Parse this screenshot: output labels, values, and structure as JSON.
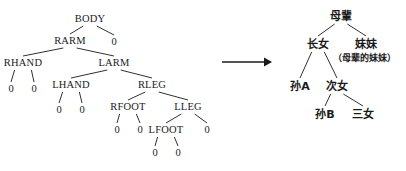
{
  "figure": {
    "type": "diagram",
    "kind": "binary-tree-transformation",
    "background_color": "#ffffff",
    "ink_color": "#1a1a1a",
    "arrow": {
      "name": "transformation-arrow",
      "direction": "right",
      "x1": 222,
      "y1": 62,
      "x2": 272,
      "y2": 62
    }
  },
  "left_tree": {
    "title": "body-parts-binary-tree",
    "nodes": [
      {
        "id": "body",
        "label": "BODY",
        "x": 90,
        "y": 19,
        "kind": "internal"
      },
      {
        "id": "rarm",
        "label": "RARM",
        "x": 70,
        "y": 41,
        "kind": "internal"
      },
      {
        "id": "n1",
        "label": "0",
        "x": 114,
        "y": 42,
        "kind": "leaf"
      },
      {
        "id": "rhand",
        "label": "RHAND",
        "x": 23,
        "y": 63,
        "kind": "internal"
      },
      {
        "id": "larm",
        "label": "LARM",
        "x": 114,
        "y": 63,
        "kind": "internal"
      },
      {
        "id": "n2",
        "label": "0",
        "x": 11,
        "y": 89,
        "kind": "leaf"
      },
      {
        "id": "n3",
        "label": "0",
        "x": 34,
        "y": 89,
        "kind": "leaf"
      },
      {
        "id": "lhand",
        "label": "LHAND",
        "x": 71,
        "y": 85,
        "kind": "internal"
      },
      {
        "id": "rleg",
        "label": "RLEG",
        "x": 152,
        "y": 85,
        "kind": "internal"
      },
      {
        "id": "n4",
        "label": "0",
        "x": 59,
        "y": 110,
        "kind": "leaf"
      },
      {
        "id": "n5",
        "label": "0",
        "x": 82,
        "y": 110,
        "kind": "leaf"
      },
      {
        "id": "rfoot",
        "label": "RFOOT",
        "x": 128,
        "y": 107,
        "kind": "internal"
      },
      {
        "id": "lleg",
        "label": "LLEG",
        "x": 188,
        "y": 107,
        "kind": "internal"
      },
      {
        "id": "n6",
        "label": "0",
        "x": 117,
        "y": 130,
        "kind": "leaf"
      },
      {
        "id": "n7",
        "label": "0",
        "x": 140,
        "y": 130,
        "kind": "leaf"
      },
      {
        "id": "lfoot",
        "label": "LFOOT",
        "x": 166,
        "y": 130,
        "kind": "internal"
      },
      {
        "id": "n8",
        "label": "0",
        "x": 207,
        "y": 130,
        "kind": "leaf"
      },
      {
        "id": "n9",
        "label": "0",
        "x": 155,
        "y": 153,
        "kind": "leaf"
      },
      {
        "id": "n10",
        "label": "0",
        "x": 178,
        "y": 153,
        "kind": "leaf"
      }
    ],
    "edges": [
      {
        "from": "body",
        "to": "rarm"
      },
      {
        "from": "body",
        "to": "n1"
      },
      {
        "from": "rarm",
        "to": "rhand"
      },
      {
        "from": "rarm",
        "to": "larm"
      },
      {
        "from": "rhand",
        "to": "n2"
      },
      {
        "from": "rhand",
        "to": "n3"
      },
      {
        "from": "larm",
        "to": "lhand"
      },
      {
        "from": "larm",
        "to": "rleg"
      },
      {
        "from": "lhand",
        "to": "n4"
      },
      {
        "from": "lhand",
        "to": "n5"
      },
      {
        "from": "rleg",
        "to": "rfoot"
      },
      {
        "from": "rleg",
        "to": "lleg"
      },
      {
        "from": "rfoot",
        "to": "n6"
      },
      {
        "from": "rfoot",
        "to": "n7"
      },
      {
        "from": "lleg",
        "to": "lfoot"
      },
      {
        "from": "lleg",
        "to": "n8"
      },
      {
        "from": "lfoot",
        "to": "n9"
      },
      {
        "from": "lfoot",
        "to": "n10"
      }
    ]
  },
  "right_tree": {
    "title": "family-relation-tree",
    "nodes": [
      {
        "id": "mubei",
        "label": "母輩",
        "x": 341,
        "y": 16,
        "kind": "cjk"
      },
      {
        "id": "zhangnv",
        "label": "长女",
        "x": 318,
        "y": 44,
        "kind": "cjk"
      },
      {
        "id": "meimei",
        "label": "妹妹",
        "x": 366,
        "y": 44,
        "kind": "cjk"
      },
      {
        "id": "note",
        "label": "（母辈的妹妹）",
        "x": 364,
        "y": 58,
        "kind": "cjk-note"
      },
      {
        "id": "sunA",
        "label": "孙A",
        "x": 300,
        "y": 86,
        "kind": "cjk"
      },
      {
        "id": "cinv",
        "label": "次女",
        "x": 337,
        "y": 86,
        "kind": "cjk"
      },
      {
        "id": "sunB",
        "label": "孙B",
        "x": 325,
        "y": 114,
        "kind": "cjk"
      },
      {
        "id": "sannv",
        "label": "三女",
        "x": 363,
        "y": 114,
        "kind": "cjk"
      }
    ],
    "edges": [
      {
        "from": "mubei",
        "to": "zhangnv"
      },
      {
        "from": "mubei",
        "to": "meimei"
      },
      {
        "from": "zhangnv",
        "to": "sunA"
      },
      {
        "from": "zhangnv",
        "to": "cinv"
      },
      {
        "from": "cinv",
        "to": "sunB"
      },
      {
        "from": "cinv",
        "to": "sannv"
      }
    ]
  }
}
